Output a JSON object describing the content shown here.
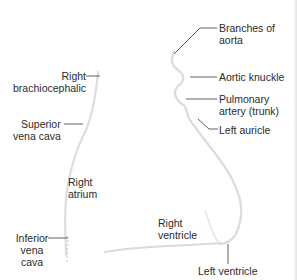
{
  "diagram": {
    "type": "anatomical-outline",
    "labels": {
      "branches_of_aorta_line1": "Branches of",
      "branches_of_aorta_line2": "aorta",
      "aortic_knuckle": "Aortic knuckle",
      "pulmonary_artery_line1": "Pulmonary",
      "pulmonary_artery_line2": "artery (trunk)",
      "left_auricle": "Left auricle",
      "right_brachiocephalic_line1": "Right",
      "right_brachiocephalic_line2": "brachiocephalic",
      "superior_vena_cava_line1": "Superior",
      "superior_vena_cava_line2": "vena cava",
      "right_atrium_line1": "Right",
      "right_atrium_line2": "atrium",
      "inferior_vena_cava_line1": "Inferior",
      "inferior_vena_cava_line2": "vena",
      "inferior_vena_cava_line3": "cava",
      "right_ventricle_line1": "Right",
      "right_ventricle_line2": "ventricle",
      "left_ventricle": "Left ventricle"
    },
    "colors": {
      "outline": "#d9d9d9",
      "leader_line": "#3a3a3a",
      "text": "#2b2b2b",
      "background": "#ffffff"
    }
  }
}
